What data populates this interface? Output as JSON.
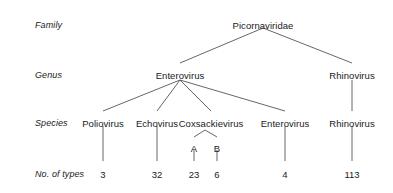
{
  "diagram": {
    "line_color": "#555555",
    "text_color": "#1a1a1a",
    "background": "#ffffff",
    "row_labels": [
      {
        "text": "Family",
        "x": 35,
        "y": 20
      },
      {
        "text": "Genus",
        "x": 35,
        "y": 70
      },
      {
        "text": "Species",
        "x": 35,
        "y": 118
      },
      {
        "text": "No. of types",
        "x": 35,
        "y": 169
      }
    ],
    "family": [
      {
        "label": "Picornaviridae",
        "x": 263,
        "y": 20
      }
    ],
    "genus": [
      {
        "label": "Enterovirus",
        "x": 180,
        "y": 70
      },
      {
        "label": "Rhinovirus",
        "x": 352,
        "y": 70
      }
    ],
    "species": [
      {
        "label": "Poliovirus",
        "x": 103,
        "y": 118
      },
      {
        "label": "Echovirus",
        "x": 157,
        "y": 118
      },
      {
        "label": "Coxsackievirus",
        "x": 211,
        "y": 118
      },
      {
        "label": "Enterovirus",
        "x": 285,
        "y": 118
      },
      {
        "label": "Rhinovirus",
        "x": 352,
        "y": 118
      }
    ],
    "subtypes": [
      {
        "label": "A",
        "x": 194,
        "y": 143
      },
      {
        "label": "B",
        "x": 217,
        "y": 143
      }
    ],
    "counts": [
      {
        "value": "3",
        "x": 103,
        "y": 169
      },
      {
        "value": "32",
        "x": 157,
        "y": 169
      },
      {
        "value": "23",
        "x": 194,
        "y": 169
      },
      {
        "value": "6",
        "x": 217,
        "y": 169
      },
      {
        "value": "4",
        "x": 285,
        "y": 169
      },
      {
        "value": "113",
        "x": 352,
        "y": 169
      }
    ],
    "edges": [
      {
        "name": "family-to-enterovirus",
        "x1": 263,
        "y1": 28,
        "x2": 180,
        "y2": 63
      },
      {
        "name": "family-to-rhinovirus",
        "x1": 263,
        "y1": 28,
        "x2": 352,
        "y2": 63
      },
      {
        "name": "enterovirus-to-poliovirus",
        "x1": 180,
        "y1": 80,
        "x2": 103,
        "y2": 111
      },
      {
        "name": "enterovirus-to-echovirus",
        "x1": 180,
        "y1": 80,
        "x2": 157,
        "y2": 111
      },
      {
        "name": "enterovirus-to-coxsackievirus",
        "x1": 180,
        "y1": 80,
        "x2": 211,
        "y2": 111
      },
      {
        "name": "enterovirus-to-enterovirus-species",
        "x1": 180,
        "y1": 80,
        "x2": 285,
        "y2": 111
      },
      {
        "name": "rhinovirus-genus-to-species",
        "x1": 352,
        "y1": 80,
        "x2": 352,
        "y2": 111
      },
      {
        "name": "coxsackievirus-to-a",
        "x1": 205,
        "y1": 130,
        "x2": 194,
        "y2": 137
      },
      {
        "name": "coxsackievirus-to-b",
        "x1": 205,
        "y1": 130,
        "x2": 217,
        "y2": 137
      },
      {
        "name": "poliovirus-to-count",
        "x1": 103,
        "y1": 126,
        "x2": 103,
        "y2": 161
      },
      {
        "name": "echovirus-to-count",
        "x1": 157,
        "y1": 126,
        "x2": 157,
        "y2": 161
      },
      {
        "name": "a-to-count",
        "x1": 194,
        "y1": 150,
        "x2": 194,
        "y2": 161
      },
      {
        "name": "b-to-count",
        "x1": 217,
        "y1": 150,
        "x2": 217,
        "y2": 161
      },
      {
        "name": "enterovirus-species-to-count",
        "x1": 285,
        "y1": 126,
        "x2": 285,
        "y2": 161
      },
      {
        "name": "rhinovirus-species-to-count",
        "x1": 352,
        "y1": 126,
        "x2": 352,
        "y2": 161
      }
    ]
  }
}
